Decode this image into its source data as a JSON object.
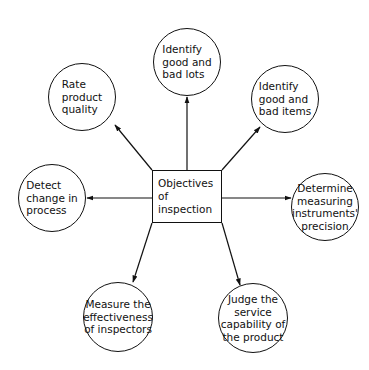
{
  "diagram": {
    "type": "hub-and-spoke",
    "center": {
      "label": "Objectives\nof\ninspection"
    },
    "objectives": [
      {
        "id": "rate-quality",
        "label": "Rate\nproduct\nquality",
        "cx": 82,
        "cy": 97,
        "r": 34,
        "align": "left"
      },
      {
        "id": "good-bad-lots",
        "label": "Identify\ngood and\nbad lots",
        "cx": 187,
        "cy": 62,
        "r": 34,
        "align": "left"
      },
      {
        "id": "good-bad-items",
        "label": "Identify\ngood and\nbad items",
        "cx": 285,
        "cy": 99,
        "r": 34,
        "align": "left"
      },
      {
        "id": "detect-change",
        "label": "Detect\nchange in\nprocess",
        "cx": 52,
        "cy": 198,
        "r": 34,
        "align": "left"
      },
      {
        "id": "instrument-precision",
        "label": "Determine\nmeasuring\ninstruments'\nprecision",
        "cx": 325,
        "cy": 207,
        "r": 34,
        "align": "center"
      },
      {
        "id": "inspector-effectiveness",
        "label": "Measure the\neffectiveness\nof inspectors",
        "cx": 118,
        "cy": 317,
        "r": 35,
        "align": "center"
      },
      {
        "id": "service-capability",
        "label": "Judge the\nservice\ncapability of\nthe product",
        "cx": 253,
        "cy": 318,
        "r": 35,
        "align": "center"
      }
    ],
    "arrows": [
      {
        "to": "rate-quality",
        "x1": 152,
        "y1": 170,
        "x2": 115,
        "y2": 125
      },
      {
        "to": "good-bad-lots",
        "x1": 187,
        "y1": 170,
        "x2": 187,
        "y2": 97
      },
      {
        "to": "good-bad-items",
        "x1": 222,
        "y1": 170,
        "x2": 260,
        "y2": 127
      },
      {
        "to": "detect-change",
        "x1": 152,
        "y1": 198,
        "x2": 87,
        "y2": 198
      },
      {
        "to": "instrument-precision",
        "x1": 222,
        "y1": 198,
        "x2": 291,
        "y2": 198
      },
      {
        "to": "inspector-effectiveness",
        "x1": 152,
        "y1": 223,
        "x2": 133,
        "y2": 282
      },
      {
        "to": "service-capability",
        "x1": 222,
        "y1": 223,
        "x2": 240,
        "y2": 285
      }
    ],
    "stroke_color": "#111111",
    "background": "#ffffff"
  }
}
